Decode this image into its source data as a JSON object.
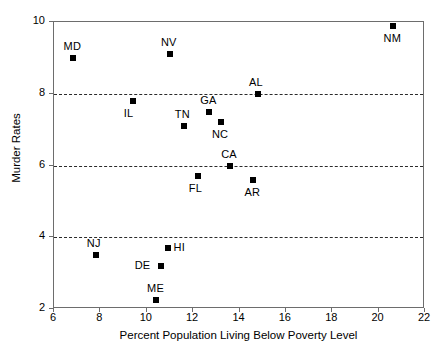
{
  "chart_data": {
    "type": "scatter",
    "title": "",
    "xlabel": "Percent Population Living Below Poverty Level",
    "ylabel": "Murder Rates",
    "xlim": [
      6,
      22
    ],
    "ylim": [
      2,
      10
    ],
    "xticks": [
      6,
      8,
      10,
      12,
      14,
      16,
      18,
      20,
      22
    ],
    "yticks": [
      2,
      4,
      6,
      8,
      10
    ],
    "grid": "horizontal dashed gridlines at y = 4, 6, 8",
    "gridlines_y": [
      4,
      6,
      8
    ],
    "legend": "none",
    "marker": "filled black square",
    "points": [
      {
        "label": "MD",
        "x": 6.8,
        "y": 9.0,
        "label_pos": "above"
      },
      {
        "label": "NV",
        "x": 11.0,
        "y": 9.1,
        "label_pos": "above"
      },
      {
        "label": "NM",
        "x": 20.6,
        "y": 9.9,
        "label_pos": "below"
      },
      {
        "label": "IL",
        "x": 9.4,
        "y": 7.8,
        "label_pos": "below"
      },
      {
        "label": "TN",
        "x": 11.6,
        "y": 7.1,
        "label_pos": "above"
      },
      {
        "label": "GA",
        "x": 12.7,
        "y": 7.5,
        "label_pos": "above"
      },
      {
        "label": "NC",
        "x": 13.2,
        "y": 7.2,
        "label_pos": "below"
      },
      {
        "label": "AL",
        "x": 14.8,
        "y": 8.0,
        "label_pos": "above"
      },
      {
        "label": "CA",
        "x": 13.6,
        "y": 6.0,
        "label_pos": "above"
      },
      {
        "label": "FL",
        "x": 12.2,
        "y": 5.7,
        "label_pos": "below"
      },
      {
        "label": "AR",
        "x": 14.6,
        "y": 5.6,
        "label_pos": "below"
      },
      {
        "label": "NJ",
        "x": 7.8,
        "y": 3.5,
        "label_pos": "above"
      },
      {
        "label": "HI",
        "x": 10.9,
        "y": 3.7,
        "label_pos": "right"
      },
      {
        "label": "DE",
        "x": 10.6,
        "y": 3.2,
        "label_pos": "left"
      },
      {
        "label": "ME",
        "x": 10.4,
        "y": 2.25,
        "label_pos": "above"
      }
    ]
  },
  "colors": {
    "marker": "#000000",
    "axis": "#6d6d6d",
    "gridline": "#2b2b2b",
    "background": "#ffffff"
  }
}
